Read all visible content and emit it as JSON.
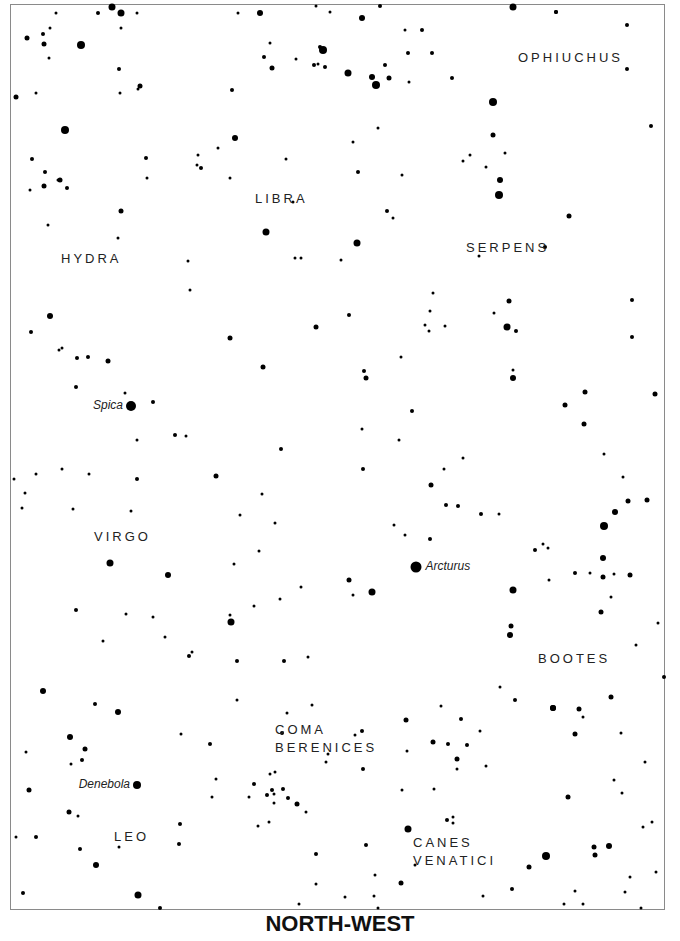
{
  "chart": {
    "direction_title": "NORTH-WEST",
    "frame_color": "#8a8a8a",
    "star_color": "#000000",
    "label_color": "#222222"
  },
  "constellations": [
    {
      "name": "OPHIUCHUS",
      "x": 518,
      "y": 51
    },
    {
      "name": "LIBRA",
      "x": 255,
      "y": 192
    },
    {
      "name": "HYDRA",
      "x": 61,
      "y": 252
    },
    {
      "name": "SERPENS",
      "x": 466,
      "y": 241
    },
    {
      "name": "VIRGO",
      "x": 94,
      "y": 530
    },
    {
      "name": "BOOTES",
      "x": 538,
      "y": 652
    },
    {
      "name": "COMA",
      "x": 275,
      "y": 723
    },
    {
      "name": "BERENICES",
      "x": 275,
      "y": 741
    },
    {
      "name": "LEO",
      "x": 114,
      "y": 830
    },
    {
      "name": "CANES",
      "x": 413,
      "y": 836
    },
    {
      "name": "VENATICI",
      "x": 413,
      "y": 854
    }
  ],
  "named_stars": [
    {
      "name": "Spica",
      "x": 131,
      "y": 406,
      "r": 5,
      "label_side": "left"
    },
    {
      "name": "Arcturus",
      "x": 416,
      "y": 567,
      "r": 5.5,
      "label_side": "right"
    },
    {
      "name": "Denebola",
      "x": 137,
      "y": 785,
      "r": 4,
      "label_side": "left"
    }
  ],
  "chart_data": {
    "type": "scatter",
    "title": "NORTH-WEST",
    "xlabel": "",
    "ylabel": "",
    "grid": false,
    "legend": "none",
    "xlim": [
      10,
      665
    ],
    "ylim": [
      4,
      910
    ],
    "annotations": [
      "OPHIUCHUS",
      "LIBRA",
      "HYDRA",
      "SERPENS",
      "VIRGO",
      "BOOTES",
      "COMA BERENICES",
      "LEO",
      "CANES VENATICI",
      "Spica",
      "Arcturus",
      "Denebola"
    ],
    "stars": [
      [
        112,
        7,
        3.5
      ],
      [
        121,
        13,
        3.5
      ],
      [
        98,
        13,
        2
      ],
      [
        56,
        13,
        1.5
      ],
      [
        137,
        13,
        1.5
      ],
      [
        238,
        13,
        1.5
      ],
      [
        260,
        13,
        3
      ],
      [
        362,
        18,
        3
      ],
      [
        513,
        7,
        3.5
      ],
      [
        556,
        12,
        2
      ],
      [
        27,
        38,
        2.5
      ],
      [
        43,
        34,
        2
      ],
      [
        44,
        44,
        2.5
      ],
      [
        81,
        45,
        4
      ],
      [
        119,
        69,
        2
      ],
      [
        140,
        86,
        2.5
      ],
      [
        16,
        97,
        2.5
      ],
      [
        50,
        28,
        1.5
      ],
      [
        36,
        93,
        1.5
      ],
      [
        65,
        130,
        4
      ],
      [
        120,
        93,
        1.5
      ],
      [
        138,
        89,
        1.5
      ],
      [
        49,
        58,
        1.5
      ],
      [
        121,
        28,
        1.5
      ],
      [
        232,
        90,
        2
      ],
      [
        272,
        68,
        2.5
      ],
      [
        264,
        57,
        2
      ],
      [
        270,
        43,
        1.5
      ],
      [
        320,
        47,
        2
      ],
      [
        323,
        50,
        4
      ],
      [
        314,
        65,
        2
      ],
      [
        318,
        64,
        1.5
      ],
      [
        325,
        67,
        2
      ],
      [
        348,
        73,
        3.5
      ],
      [
        372,
        77,
        3
      ],
      [
        376,
        85,
        4
      ],
      [
        389,
        78,
        2.5
      ],
      [
        408,
        53,
        2
      ],
      [
        405,
        30,
        1.5
      ],
      [
        380,
        6,
        2
      ],
      [
        385,
        65,
        2
      ],
      [
        409,
        82,
        1.5
      ],
      [
        296,
        59,
        1.5
      ],
      [
        316,
        6,
        1.5
      ],
      [
        330,
        12,
        1.5
      ],
      [
        493,
        102,
        4
      ],
      [
        556,
        12,
        2
      ],
      [
        627,
        25,
        2
      ],
      [
        627,
        69,
        2
      ],
      [
        651,
        126,
        2
      ],
      [
        493,
        135,
        2.5
      ],
      [
        500,
        180,
        3
      ],
      [
        499,
        195,
        4
      ],
      [
        505,
        153,
        1.5
      ],
      [
        486,
        167,
        1.5
      ],
      [
        432,
        53,
        2
      ],
      [
        422,
        30,
        2
      ],
      [
        452,
        78,
        2
      ],
      [
        470,
        155,
        1.5
      ],
      [
        463,
        161,
        1.5
      ],
      [
        402,
        175,
        1.5
      ],
      [
        387,
        211,
        2
      ],
      [
        393,
        218,
        1.5
      ],
      [
        353,
        142,
        1.5
      ],
      [
        358,
        172,
        2
      ],
      [
        378,
        128,
        1.5
      ],
      [
        357,
        243,
        3.5
      ],
      [
        266,
        232,
        3.5
      ],
      [
        235,
        138,
        3
      ],
      [
        201,
        168,
        2
      ],
      [
        197,
        165,
        1.5
      ],
      [
        198,
        155,
        1.5
      ],
      [
        230,
        178,
        1.5
      ],
      [
        218,
        148,
        1.5
      ],
      [
        286,
        159,
        1.5
      ],
      [
        293,
        202,
        1.5
      ],
      [
        295,
        258,
        1.5
      ],
      [
        301,
        258,
        1.5
      ],
      [
        188,
        261,
        1.5
      ],
      [
        190,
        290,
        1.5
      ],
      [
        147,
        178,
        1.5
      ],
      [
        146,
        158,
        2
      ],
      [
        45,
        172,
        2
      ],
      [
        58,
        180,
        1.5
      ],
      [
        44,
        186,
        2.5
      ],
      [
        60,
        180,
        2.5
      ],
      [
        67,
        188,
        2
      ],
      [
        32,
        159,
        2
      ],
      [
        30,
        190,
        1.5
      ],
      [
        121,
        211,
        2.5
      ],
      [
        48,
        225,
        1.5
      ],
      [
        118,
        238,
        1.5
      ],
      [
        50,
        316,
        3
      ],
      [
        31,
        332,
        2
      ],
      [
        59,
        350,
        1.5
      ],
      [
        62,
        348,
        1.5
      ],
      [
        77,
        358,
        2
      ],
      [
        88,
        357,
        2
      ],
      [
        108,
        361,
        2.5
      ],
      [
        76,
        387,
        2
      ],
      [
        125,
        393,
        1.5
      ],
      [
        153,
        402,
        2
      ],
      [
        175,
        435,
        2
      ],
      [
        186,
        436,
        1.5
      ],
      [
        137,
        440,
        1.5
      ],
      [
        230,
        338,
        2.5
      ],
      [
        263,
        367,
        2.5
      ],
      [
        316,
        327,
        2.5
      ],
      [
        281,
        449,
        2
      ],
      [
        216,
        476,
        2.5
      ],
      [
        262,
        494,
        1.5
      ],
      [
        349,
        315,
        2
      ],
      [
        364,
        371,
        2
      ],
      [
        366,
        378,
        2.5
      ],
      [
        399,
        440,
        1.5
      ],
      [
        425,
        325,
        1.5
      ],
      [
        429,
        331,
        1.5
      ],
      [
        430,
        311,
        1.5
      ],
      [
        445,
        326,
        1.5
      ],
      [
        401,
        357,
        1.5
      ],
      [
        509,
        301,
        2.5
      ],
      [
        507,
        327,
        3.5
      ],
      [
        516,
        331,
        2
      ],
      [
        513,
        370,
        1.5
      ],
      [
        513,
        378,
        3
      ],
      [
        545,
        247,
        2
      ],
      [
        569,
        216,
        2.5
      ],
      [
        632,
        300,
        2
      ],
      [
        632,
        337,
        2
      ],
      [
        585,
        392,
        2.5
      ],
      [
        584,
        424,
        2.5
      ],
      [
        565,
        405,
        2.5
      ],
      [
        655,
        394,
        2.5
      ],
      [
        604,
        454,
        1.5
      ],
      [
        623,
        477,
        1.5
      ],
      [
        341,
        260,
        1.5
      ],
      [
        362,
        429,
        1.5
      ],
      [
        479,
        256,
        1.5
      ],
      [
        494,
        313,
        1.5
      ],
      [
        433,
        293,
        1.5
      ],
      [
        412,
        411,
        2
      ],
      [
        463,
        458,
        1.5
      ],
      [
        499,
        514,
        1.5
      ],
      [
        444,
        469,
        1.5
      ],
      [
        446,
        505,
        2
      ],
      [
        458,
        506,
        2
      ],
      [
        481,
        514,
        2
      ],
      [
        431,
        485,
        2.5
      ],
      [
        363,
        469,
        2
      ],
      [
        405,
        535,
        1.5
      ],
      [
        394,
        525,
        1.5
      ],
      [
        430,
        539,
        2
      ],
      [
        604,
        526,
        4
      ],
      [
        615,
        512,
        3
      ],
      [
        628,
        501,
        2.5
      ],
      [
        647,
        500,
        2.5
      ],
      [
        603,
        558,
        3
      ],
      [
        603,
        577,
        2.5
      ],
      [
        614,
        574,
        1.5
      ],
      [
        630,
        575,
        2.5
      ],
      [
        575,
        573,
        2
      ],
      [
        535,
        550,
        2
      ],
      [
        548,
        548,
        1.5
      ],
      [
        543,
        544,
        1.5
      ],
      [
        549,
        580,
        1.5
      ],
      [
        601,
        612,
        2.5
      ],
      [
        611,
        597,
        1.5
      ],
      [
        590,
        573,
        1.5
      ],
      [
        513,
        590,
        3.5
      ],
      [
        511,
        626,
        2.5
      ],
      [
        510,
        635,
        3
      ],
      [
        636,
        645,
        1.5
      ],
      [
        658,
        623,
        1.5
      ],
      [
        664,
        677,
        2
      ],
      [
        611,
        697,
        2.5
      ],
      [
        553,
        708,
        3
      ],
      [
        621,
        733,
        1.5
      ],
      [
        645,
        762,
        1.5
      ],
      [
        622,
        793,
        1.5
      ],
      [
        349,
        580,
        2.5
      ],
      [
        353,
        595,
        1.5
      ],
      [
        372,
        592,
        3.5
      ],
      [
        301,
        587,
        1.5
      ],
      [
        308,
        657,
        1.5
      ],
      [
        284,
        661,
        2
      ],
      [
        280,
        599,
        1.5
      ],
      [
        275,
        523,
        1.5
      ],
      [
        259,
        551,
        1.5
      ],
      [
        254,
        606,
        1.5
      ],
      [
        231,
        622,
        3.5
      ],
      [
        237,
        661,
        2
      ],
      [
        230,
        615,
        1.5
      ],
      [
        168,
        575,
        3
      ],
      [
        110,
        563,
        3.5
      ],
      [
        76,
        610,
        2
      ],
      [
        103,
        641,
        1.5
      ],
      [
        126,
        614,
        1.5
      ],
      [
        153,
        617,
        1.5
      ],
      [
        165,
        637,
        1.5
      ],
      [
        189,
        656,
        2
      ],
      [
        192,
        652,
        1.5
      ],
      [
        234,
        564,
        1.5
      ],
      [
        240,
        515,
        1.5
      ],
      [
        25,
        493,
        1.5
      ],
      [
        36,
        474,
        1.5
      ],
      [
        22,
        508,
        1.5
      ],
      [
        62,
        469,
        1.5
      ],
      [
        89,
        474,
        1.5
      ],
      [
        131,
        511,
        1.5
      ],
      [
        137,
        479,
        2
      ],
      [
        73,
        509,
        1.5
      ],
      [
        14,
        479,
        1.5
      ],
      [
        43,
        691,
        3
      ],
      [
        118,
        712,
        3
      ],
      [
        95,
        704,
        2
      ],
      [
        70,
        737,
        3
      ],
      [
        85,
        749,
        2.5
      ],
      [
        82,
        760,
        2
      ],
      [
        71,
        764,
        1.5
      ],
      [
        26,
        752,
        1.5
      ],
      [
        29,
        790,
        2.5
      ],
      [
        69,
        812,
        2.5
      ],
      [
        78,
        816,
        1.5
      ],
      [
        16,
        837,
        1.5
      ],
      [
        36,
        837,
        2
      ],
      [
        96,
        865,
        3
      ],
      [
        138,
        895,
        3.5
      ],
      [
        160,
        908,
        2
      ],
      [
        80,
        849,
        2
      ],
      [
        119,
        847,
        1.5
      ],
      [
        180,
        824,
        2
      ],
      [
        179,
        844,
        2
      ],
      [
        210,
        744,
        2
      ],
      [
        237,
        700,
        1.5
      ],
      [
        181,
        734,
        1.5
      ],
      [
        216,
        779,
        1.5
      ],
      [
        254,
        784,
        2
      ],
      [
        212,
        797,
        1.5
      ],
      [
        287,
        713,
        1.5
      ],
      [
        282,
        733,
        2
      ],
      [
        270,
        774,
        1.5
      ],
      [
        275,
        772,
        1.5
      ],
      [
        272,
        790,
        2
      ],
      [
        283,
        789,
        2
      ],
      [
        267,
        795,
        2
      ],
      [
        274,
        794,
        1.5
      ],
      [
        288,
        798,
        2
      ],
      [
        297,
        804,
        2.5
      ],
      [
        274,
        803,
        1.5
      ],
      [
        269,
        822,
        1.5
      ],
      [
        306,
        812,
        1.5
      ],
      [
        249,
        797,
        1.5
      ],
      [
        258,
        826,
        1.5
      ],
      [
        362,
        731,
        2
      ],
      [
        355,
        735,
        1.5
      ],
      [
        363,
        769,
        2
      ],
      [
        328,
        754,
        1.5
      ],
      [
        326,
        762,
        1.5
      ],
      [
        312,
        705,
        1.5
      ],
      [
        316,
        854,
        2
      ],
      [
        299,
        904,
        1.5
      ],
      [
        316,
        884,
        1.5
      ],
      [
        345,
        897,
        1.5
      ],
      [
        366,
        845,
        2
      ],
      [
        375,
        875,
        1.5
      ],
      [
        401,
        883,
        2.5
      ],
      [
        408,
        829,
        3.5
      ],
      [
        402,
        790,
        1.5
      ],
      [
        407,
        751,
        1.5
      ],
      [
        441,
        706,
        1.5
      ],
      [
        448,
        744,
        2
      ],
      [
        457,
        759,
        2.5
      ],
      [
        457,
        769,
        1.5
      ],
      [
        467,
        745,
        2
      ],
      [
        461,
        719,
        2
      ],
      [
        433,
        742,
        2.5
      ],
      [
        500,
        687,
        1.5
      ],
      [
        515,
        700,
        2
      ],
      [
        553,
        708,
        3
      ],
      [
        579,
        709,
        2.5
      ],
      [
        583,
        717,
        1.5
      ],
      [
        568,
        797,
        2.5
      ],
      [
        575,
        734,
        2.5
      ],
      [
        594,
        847,
        2.5
      ],
      [
        595,
        855,
        2.5
      ],
      [
        609,
        846,
        3
      ],
      [
        546,
        856,
        4
      ],
      [
        529,
        867,
        2.5
      ],
      [
        512,
        889,
        2
      ],
      [
        564,
        904,
        1.5
      ],
      [
        575,
        891,
        1.5
      ],
      [
        583,
        904,
        1.5
      ],
      [
        625,
        892,
        1.5
      ],
      [
        630,
        877,
        1.5
      ],
      [
        641,
        908,
        1.5
      ],
      [
        656,
        872,
        1.5
      ],
      [
        652,
        822,
        1.5
      ],
      [
        614,
        780,
        1.5
      ],
      [
        643,
        827,
        1.5
      ],
      [
        374,
        896,
        1.5
      ],
      [
        378,
        908,
        1.5
      ],
      [
        415,
        865,
        1.5
      ],
      [
        447,
        820,
        2
      ],
      [
        453,
        817,
        1.5
      ],
      [
        453,
        823,
        1.5
      ],
      [
        406,
        720,
        2.5
      ],
      [
        434,
        789,
        1.5
      ],
      [
        480,
        731,
        1.5
      ],
      [
        486,
        766,
        1.5
      ],
      [
        23,
        893,
        2
      ],
      [
        483,
        896,
        1.5
      ]
    ]
  }
}
